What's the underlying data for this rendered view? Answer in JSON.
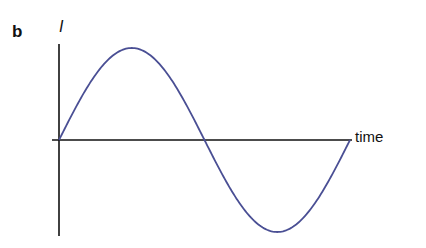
{
  "panel_label": "b",
  "axes": {
    "y_label": "I",
    "x_label": "time"
  },
  "curve": {
    "type": "sine",
    "cycles": 1,
    "color": "#4a4f94"
  },
  "axis_color": "#111111"
}
